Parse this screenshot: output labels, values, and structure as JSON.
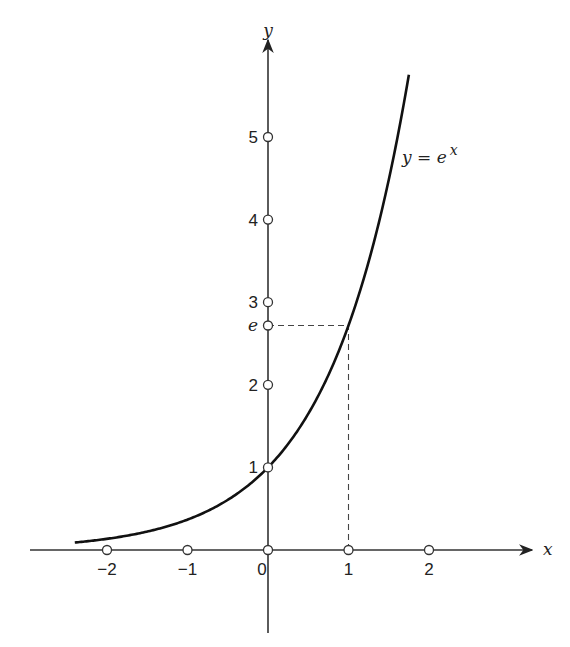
{
  "chart_data": {
    "type": "line",
    "title": "",
    "xlabel": "x",
    "ylabel": "y",
    "series": [
      {
        "name": "y = e^x",
        "function": "exp(x)",
        "x_range": [
          -2.4,
          1.75
        ]
      }
    ],
    "x_ticks": [
      -2,
      -1,
      0,
      1,
      2
    ],
    "x_tick_labels": [
      "−2",
      "−1",
      "0",
      "1",
      "2"
    ],
    "y_ticks": [
      1,
      2,
      2.718,
      3,
      4,
      5
    ],
    "y_tick_labels": [
      "1",
      "2",
      "e",
      "3",
      "4",
      "5"
    ],
    "annotations": [
      {
        "text": "y = e",
        "superscript": "x",
        "near": [
          1.7,
          5.2
        ]
      },
      {
        "type": "dashed-guide",
        "from": [
          0,
          2.718
        ],
        "to": [
          1,
          2.718
        ]
      },
      {
        "type": "dashed-guide",
        "from": [
          1,
          0
        ],
        "to": [
          1,
          2.718
        ]
      }
    ],
    "xlim": [
      -3,
      3.2
    ],
    "ylim": [
      -1,
      6.6
    ],
    "grid": false,
    "legend": "none"
  },
  "labels": {
    "x_axis": "x",
    "y_axis": "y",
    "curve_label_main": "y = e",
    "curve_label_sup": "x"
  }
}
